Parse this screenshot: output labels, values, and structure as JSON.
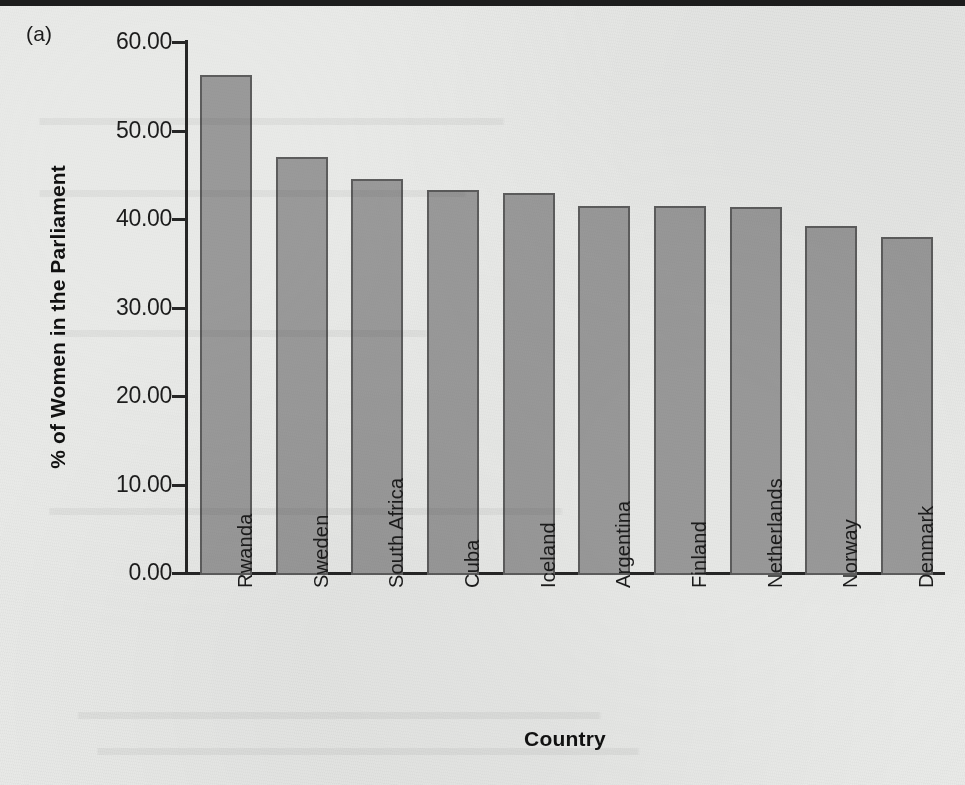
{
  "panel": {
    "label": "(a)"
  },
  "chart_data": {
    "type": "bar",
    "title": "",
    "subtitle": "",
    "xlabel": "Country",
    "ylabel": "% of Women in the Parliament",
    "categories": [
      "Rwanda",
      "Sweden",
      "South Africa",
      "Cuba",
      "Iceland",
      "Argentina",
      "Finland",
      "Netherlands",
      "Norway",
      "Denmark"
    ],
    "values": [
      56.3,
      47.0,
      44.5,
      43.3,
      42.9,
      41.5,
      41.5,
      41.3,
      39.2,
      38.0
    ],
    "ylim": [
      0,
      60
    ],
    "ytick_values": [
      0,
      10,
      20,
      30,
      40,
      50,
      60
    ],
    "ytick_labels": [
      "0.00",
      "10.00",
      "20.00",
      "30.00",
      "40.00",
      "50.00",
      "60.00"
    ],
    "grid": false,
    "legend": null,
    "legend_position": "none",
    "bar_color": "#9a9a9a",
    "bar_border_color": "#5d5d5d",
    "axis_color": "#262626",
    "background_color": "#e9eae8",
    "x_tick_label_rotation": -90
  }
}
